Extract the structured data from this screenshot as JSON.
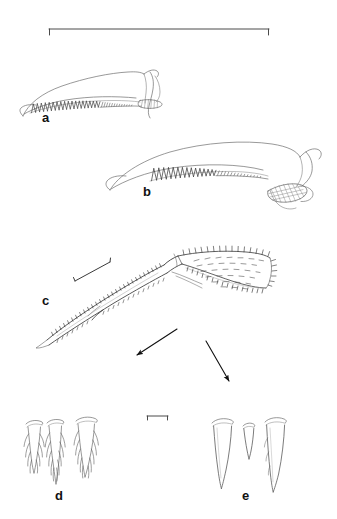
{
  "plate": {
    "title": "Scientific line-drawing plate of crustacean mouthpart appendages",
    "background_color": "#ffffff",
    "ink_color": "#1a1a1a",
    "width": 337,
    "height": 519,
    "panel_count": 5
  },
  "labels": {
    "a": "a",
    "b": "b",
    "c": "c",
    "d": "d",
    "e": "e"
  },
  "panels": [
    {
      "id": "a",
      "label": "a",
      "caption": "a",
      "description": "Curved elongate mandible-like appendage with a row of comb teeth along the ventral margin and a hatched terminal pad",
      "label_x": 42,
      "label_y": 118
    },
    {
      "id": "b",
      "label": "b",
      "caption": "b",
      "description": "Larger curved elongate appendage with serrate comb row and cross-hatched distal pad",
      "label_x": 143,
      "label_y": 192
    },
    {
      "id": "c",
      "label": "c",
      "caption": "c",
      "description": "Bent two-segmented appendage; proximal segment slender and setose, distal segment broad and densely covered with short setae",
      "label_x": 42,
      "label_y": 302
    },
    {
      "id": "d",
      "label": "d",
      "caption": "d",
      "description": "Three plumose branched setae tips",
      "label_x": 55,
      "label_y": 497
    },
    {
      "id": "e",
      "label": "e",
      "caption": "e",
      "description": "Three simple tapering spiniform setae tips",
      "label_x": 242,
      "label_y": 497
    }
  ],
  "scale_bars": [
    {
      "id": "scale-bar-top",
      "for_panels": "a, b",
      "orientation": "horizontal",
      "x1": 49,
      "y1": 29,
      "x2": 269,
      "y2": 29,
      "tick_length": 6,
      "tick_direction": "down",
      "label": ""
    },
    {
      "id": "scale-bar-c",
      "for_panels": "c",
      "orientation": "diagonal",
      "x1": 75,
      "y1": 281,
      "x2": 110,
      "y2": 262,
      "tick_length": 5,
      "tick_direction": "end-caps",
      "label": ""
    },
    {
      "id": "scale-bar-de",
      "for_panels": "d, e",
      "orientation": "horizontal",
      "x1": 147,
      "y1": 416,
      "x2": 168,
      "y2": 416,
      "tick_length": 4,
      "tick_direction": "down",
      "label": ""
    }
  ],
  "arrows": [
    {
      "id": "arrow-to-d",
      "points_to": "d",
      "x1": 177,
      "y1": 329,
      "x2": 137,
      "y2": 355,
      "head": "end"
    },
    {
      "id": "arrow-to-e",
      "points_to": "e",
      "x1": 206,
      "y1": 341,
      "x2": 229,
      "y2": 381,
      "head": "end"
    }
  ]
}
